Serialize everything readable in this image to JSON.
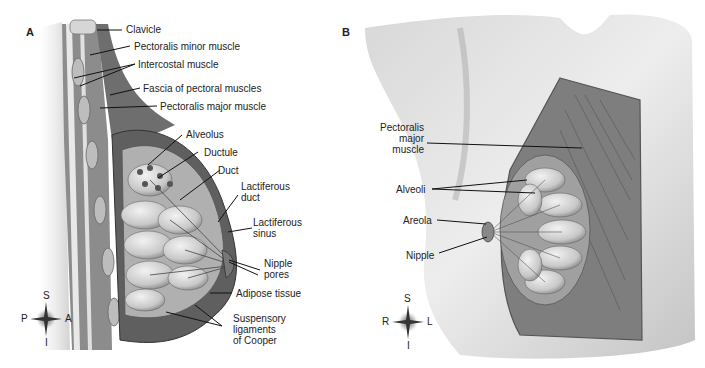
{
  "panels": [
    {
      "letter": "A",
      "labels": {
        "clavicle": "Clavicle",
        "pectoralis_minor": "Pectoralis minor muscle",
        "intercostal": "Intercostal muscle",
        "fascia": "Fascia of pectoral muscles",
        "pectoralis_major": "Pectoralis major muscle",
        "alveolus": "Alveolus",
        "ductule": "Ductule",
        "duct": "Duct",
        "lactiferous_duct_1": "Lactiferous",
        "lactiferous_duct_2": "duct",
        "lactiferous_sinus_1": "Lactiferous",
        "lactiferous_sinus_2": "sinus",
        "nipple_pores_1": "Nipple",
        "nipple_pores_2": "pores",
        "adipose": "Adipose tissue",
        "suspensory_1": "Suspensory",
        "suspensory_2": "ligaments",
        "suspensory_3": "of Cooper"
      },
      "compass": {
        "top": "S",
        "bottom": "I",
        "left": "P",
        "right": "A"
      }
    },
    {
      "letter": "B",
      "labels": {
        "pectoralis_1": "Pectoralis",
        "pectoralis_2": "major",
        "pectoralis_3": "muscle",
        "alveoli": "Alveoli",
        "areola": "Areola",
        "nipple": "Nipple"
      },
      "compass": {
        "top": "S",
        "bottom": "I",
        "left": "R",
        "right": "L"
      }
    }
  ]
}
